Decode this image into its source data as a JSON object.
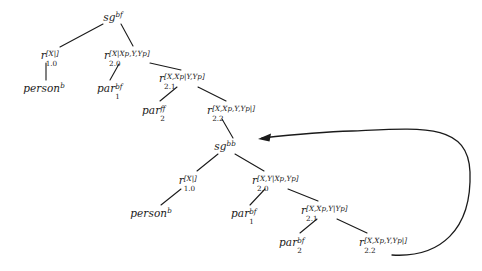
{
  "figure": {
    "background_color": "#ffffff",
    "line_color": "#1a1a1a",
    "text_color": "#1a1a1a"
  },
  "nodes": [
    {
      "id": "sg-bf",
      "label": "sg^{bf}",
      "base": "sg",
      "sub": "",
      "sup": "bf",
      "x": 113,
      "y": 17
    },
    {
      "id": "r10-upper",
      "label": "r_{1.0}^{[X|]}",
      "base": "r",
      "sub": "1.0",
      "sup": "[X|]",
      "x": 51,
      "y": 55
    },
    {
      "id": "r20-upper",
      "label": "r_{2.0}^{[X|Xp,Y,Yp]}",
      "base": "r",
      "sub": "2.0",
      "sup": "[X|Xp,Y,Yp]",
      "x": 128,
      "y": 55
    },
    {
      "id": "person-upper",
      "label": "person^{b}",
      "base": "person",
      "sub": "",
      "sup": "b",
      "x": 44,
      "y": 88
    },
    {
      "id": "par1-upper",
      "label": "par_{1}^{bf}",
      "base": "par",
      "sub": "1",
      "sup": "bf",
      "x": 110,
      "y": 88
    },
    {
      "id": "r21-upper",
      "label": "r_{2.1}^{[X,Xp|Y,Yp]}",
      "base": "r",
      "sub": "2.1",
      "sup": "[X,Xp|Y,Yp]",
      "x": 183,
      "y": 78
    },
    {
      "id": "par2-upper",
      "label": "par_{2}^{ff}",
      "base": "par",
      "sub": "2",
      "sup": "ff",
      "x": 155,
      "y": 110
    },
    {
      "id": "r22-upper",
      "label": "r_{2.2}^{[X,Xp,Y,Yp|]}",
      "base": "r",
      "sub": "2.2",
      "sup": "[X,Xp,Y,Yp|]",
      "x": 233,
      "y": 110
    },
    {
      "id": "sg-bb",
      "label": "sg^{bb}",
      "base": "sg",
      "sub": "",
      "sup": "bb",
      "x": 225,
      "y": 146
    },
    {
      "id": "r10-lower",
      "label": "r_{1.0}^{[X|]}",
      "base": "r",
      "sub": "1.0",
      "sup": "[X|]",
      "x": 189,
      "y": 180
    },
    {
      "id": "r20-lower",
      "label": "r_{2.0}^{[X,Y|Xp,Yp]}",
      "base": "r",
      "sub": "2.0",
      "sup": "[X,Y|Xp,Yp]",
      "x": 276,
      "y": 180
    },
    {
      "id": "person-lower",
      "label": "person^{b}",
      "base": "person",
      "sub": "",
      "sup": "b",
      "x": 151,
      "y": 213
    },
    {
      "id": "par1-lower",
      "label": "par_{1}^{bf}",
      "base": "par",
      "sub": "1",
      "sup": "bf",
      "x": 244,
      "y": 213
    },
    {
      "id": "r21-lower",
      "label": "r_{2.1}^{[X,Xp,Y|Yp]}",
      "base": "r",
      "sub": "2.1",
      "sup": "[X,Xp,Y|Yp]",
      "x": 325,
      "y": 210
    },
    {
      "id": "par2-lower",
      "label": "par_{2}^{bf}",
      "base": "par",
      "sub": "2",
      "sup": "bf",
      "x": 292,
      "y": 242
    },
    {
      "id": "r22-lower",
      "label": "r_{2.2}^{[X,Xp,Y,Yp|]}",
      "base": "r",
      "sub": "2.2",
      "sup": "[X,Xp,Y,Yp|]",
      "x": 385,
      "y": 242
    }
  ],
  "edges": [
    {
      "id": "e-sgbf-r10",
      "from": "sg-bf",
      "to": "r10-upper",
      "x1": 103,
      "y1": 24,
      "x2": 60,
      "y2": 47
    },
    {
      "id": "e-sgbf-r20",
      "from": "sg-bf",
      "to": "r20-upper",
      "x1": 121,
      "y1": 24,
      "x2": 133,
      "y2": 46
    },
    {
      "id": "e-r10-person",
      "from": "r10-upper",
      "to": "person-upper",
      "x1": 46,
      "y1": 63,
      "x2": 46,
      "y2": 80
    },
    {
      "id": "e-r20-par1",
      "from": "r20-upper",
      "to": "par1-upper",
      "x1": 119,
      "y1": 64,
      "x2": 110,
      "y2": 80
    },
    {
      "id": "e-r20-r21",
      "from": "r20-upper",
      "to": "r21-upper",
      "x1": 150,
      "y1": 63,
      "x2": 181,
      "y2": 70
    },
    {
      "id": "e-r21-par2",
      "from": "r21-upper",
      "to": "par2-upper",
      "x1": 177,
      "y1": 87,
      "x2": 160,
      "y2": 101
    },
    {
      "id": "e-r21-r22",
      "from": "r21-upper",
      "to": "r22-upper",
      "x1": 198,
      "y1": 87,
      "x2": 226,
      "y2": 101
    },
    {
      "id": "e-r22-sgbb",
      "from": "r22-upper",
      "to": "sg-bb",
      "x1": 222,
      "y1": 119,
      "x2": 233,
      "y2": 138
    },
    {
      "id": "e-sgbb-r10l",
      "from": "sg-bb",
      "to": "r10-lower",
      "x1": 218,
      "y1": 154,
      "x2": 197,
      "y2": 171
    },
    {
      "id": "e-sgbb-r20l",
      "from": "sg-bb",
      "to": "r20-lower",
      "x1": 235,
      "y1": 154,
      "x2": 264,
      "y2": 171
    },
    {
      "id": "e-r10l-personl",
      "from": "r10-lower",
      "to": "person-lower",
      "x1": 181,
      "y1": 189,
      "x2": 161,
      "y2": 205
    },
    {
      "id": "e-r20l-par1l",
      "from": "r20-lower",
      "to": "par1-lower",
      "x1": 265,
      "y1": 189,
      "x2": 250,
      "y2": 205
    },
    {
      "id": "e-r20l-r21l",
      "from": "r20-lower",
      "to": "r21-lower",
      "x1": 288,
      "y1": 189,
      "x2": 318,
      "y2": 201
    },
    {
      "id": "e-r21l-par2l",
      "from": "r21-lower",
      "to": "par2-lower",
      "x1": 317,
      "y1": 219,
      "x2": 300,
      "y2": 233
    },
    {
      "id": "e-r21l-r22l",
      "from": "r21-lower",
      "to": "r22-lower",
      "x1": 337,
      "y1": 219,
      "x2": 367,
      "y2": 233
    }
  ],
  "recursion_arrow": {
    "id": "recursive-call-arrow",
    "description": "curved arrow from bottom r_2.2 goal back up to sg^{bb}",
    "from": "r22-lower",
    "to": "sg-bb",
    "path": "M 392 255 C 440 258, 472 230, 470 172 C 468 122, 420 128, 352 131 C 320 132, 290 135, 262 138",
    "arrowhead_at": {
      "x": 258,
      "y": 139
    }
  }
}
